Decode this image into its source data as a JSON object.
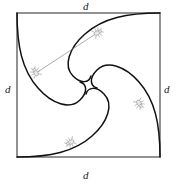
{
  "figure": {
    "labels": {
      "top": "d",
      "right": "d",
      "bottom": "d",
      "left": "d"
    },
    "colors": {
      "square_stroke": "#4a4a4a",
      "curve_stroke": "#111111",
      "sightline_stroke": "#8a8a8a",
      "bug_stroke": "#9a9a9a",
      "bug_fill": "#e8e8e8",
      "background": "#ffffff"
    },
    "square": {
      "x": 17,
      "y": 13,
      "width": 143,
      "height": 144,
      "stroke_width": 1.2
    },
    "center": {
      "x": 88.5,
      "y": 85
    },
    "bugs": [
      {
        "name": "bug-top",
        "x": 97,
        "y": 33,
        "angle": -28
      },
      {
        "name": "bug-right",
        "x": 139,
        "y": 103,
        "angle": 62
      },
      {
        "name": "bug-bottom",
        "x": 71,
        "y": 142,
        "angle": 152
      },
      {
        "name": "bug-left",
        "x": 36,
        "y": 73,
        "angle": 242
      }
    ],
    "sightline": {
      "x1": 36,
      "y1": 73,
      "x2": 97,
      "y2": 33
    },
    "curves": [
      {
        "name": "pursuit-curve-from-top-left",
        "path": "M 17 13 C 17 46 22 70 38 88 C 52 104 70 110 80 100 C 88 92 87 84 80 82"
      },
      {
        "name": "pursuit-curve-from-top-right",
        "path": "M 160 13 C 127 13 103 18 85 34 C 69 48 63 66 73 76 C 81 84 89 83 91 76"
      },
      {
        "name": "pursuit-curve-from-bottom-right",
        "path": "M 160 157 C 160 124 155 100 139 82 C 125 66 107 60 97 70 C 89 78 90 86 97 88"
      },
      {
        "name": "pursuit-curve-from-bottom-left",
        "path": "M 17 157 C 50 157 74 152 92 136 C 108 122 114 104 104 94 C 96 86 88 87 86 94"
      }
    ]
  }
}
